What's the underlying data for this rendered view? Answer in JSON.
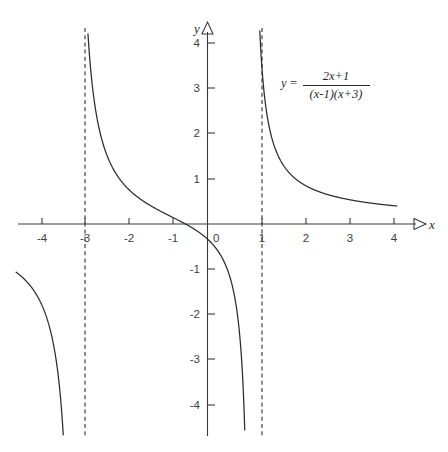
{
  "figure": {
    "title": "",
    "background_color": "#ffffff",
    "curve_color": "#2b2b2b",
    "axis_color": "#3a3a3a",
    "asymptote_color": "#2f2f2f"
  },
  "equation": {
    "lhs": "y",
    "equals": "=",
    "numerator": "2x+1",
    "denominator": "(x-1)(x+3)",
    "full": "y = (2x+1)/((x-1)(x+3))"
  },
  "axes": {
    "x_label": "x",
    "y_label": "y",
    "x_ticks": [
      "-4",
      "-3",
      "-2",
      "-1",
      "1",
      "2",
      "3",
      "4"
    ],
    "y_ticks": [
      "4",
      "3",
      "2",
      "1",
      "-1",
      "-2",
      "-3",
      "-4"
    ],
    "origin_label": "0"
  },
  "chart_data": {
    "type": "line",
    "title": "",
    "xlabel": "x",
    "ylabel": "y",
    "xlim": [
      -4.6,
      4.6
    ],
    "ylim": [
      -4.6,
      4.6
    ],
    "grid": false,
    "legend": "none",
    "annotations": [
      {
        "text": "y = (2x+1)/((x-1)(x+3))",
        "x": 2.05,
        "y": 3.15
      }
    ],
    "xticks": [
      -4,
      -3,
      -2,
      -1,
      1,
      2,
      3,
      4
    ],
    "yticks": [
      -4,
      -3,
      -2,
      -1,
      1,
      2,
      3,
      4
    ],
    "function": "y = (2x+1)/((x-1)(x+3))",
    "vertical_asymptotes": [
      -3,
      1
    ],
    "horizontal_asymptote": 0,
    "x_intercepts": [
      -0.5
    ],
    "y_intercepts": [
      -0.3333
    ],
    "series": [
      {
        "name": "branch-left (x < -3)",
        "x_range": [
          -4.35,
          -3.02
        ],
        "points": [
          {
            "x": -4.35,
            "y": -0.289
          },
          {
            "x": -4.2,
            "y": -0.317
          },
          {
            "x": -4.0,
            "y": -0.36
          },
          {
            "x": -3.8,
            "y": -0.416
          },
          {
            "x": -3.6,
            "y": -0.492
          },
          {
            "x": -3.4,
            "y": -0.602
          },
          {
            "x": -3.25,
            "y": -0.729
          },
          {
            "x": -3.15,
            "y": -0.868
          },
          {
            "x": -3.08,
            "y": -1.053
          },
          {
            "x": -3.04,
            "y": -1.271
          },
          {
            "x": -3.02,
            "y": -1.516
          }
        ]
      },
      {
        "name": "branch-middle (-3 < x < 1)",
        "x_range": [
          -2.94,
          0.975
        ],
        "points": [
          {
            "x": -2.94,
            "y": 4.28
          },
          {
            "x": -2.9,
            "y": 3.6
          },
          {
            "x": -2.8,
            "y": 2.53
          },
          {
            "x": -2.6,
            "y": 1.66
          },
          {
            "x": -2.4,
            "y": 1.31
          },
          {
            "x": -2.0,
            "y": 1.0
          },
          {
            "x": -1.5,
            "y": 0.889
          },
          {
            "x": -1.0,
            "y": 0.5
          },
          {
            "x": -0.5,
            "y": 0.0
          },
          {
            "x": 0.0,
            "y": -0.333
          },
          {
            "x": 0.5,
            "y": -0.914
          },
          {
            "x": 0.75,
            "y": -1.524
          },
          {
            "x": 0.9,
            "y": -3.59
          },
          {
            "x": 0.95,
            "y": -7.4
          }
        ]
      },
      {
        "name": "branch-right (x > 1)",
        "x_range": [
          1.03,
          4.3
        ],
        "points": [
          {
            "x": 1.03,
            "y": 25.3
          },
          {
            "x": 1.1,
            "y": 7.8
          },
          {
            "x": 1.2,
            "y": 4.05
          },
          {
            "x": 1.4,
            "y": 2.0
          },
          {
            "x": 1.6,
            "y": 1.37
          },
          {
            "x": 2.0,
            "y": 1.0
          },
          {
            "x": 2.5,
            "y": 0.727
          },
          {
            "x": 3.0,
            "y": 0.583
          },
          {
            "x": 3.5,
            "y": 0.492
          },
          {
            "x": 4.0,
            "y": 0.429
          },
          {
            "x": 4.3,
            "y": 0.4
          }
        ]
      }
    ]
  }
}
